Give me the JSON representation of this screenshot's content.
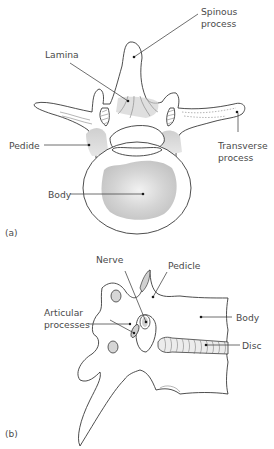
{
  "figure": {
    "panels": [
      {
        "id": "a",
        "marker": "(a)",
        "view": "superior (top-down) view of vertebra",
        "labels": {
          "spinous_process_1": "Spinous",
          "spinous_process_2": "process",
          "lamina": "Lamina",
          "pedicle": "Pedide",
          "transverse_process_1": "Transverse",
          "transverse_process_2": "process",
          "body": "Body"
        }
      },
      {
        "id": "b",
        "marker": "(b)",
        "view": "lateral view of vertebrae with disc",
        "labels": {
          "nerve": "Nerve",
          "pedicle": "Pedicle",
          "articular_processes_1": "Articular",
          "articular_processes_2": "processes",
          "body": "Body",
          "disc": "Disc"
        }
      }
    ],
    "colors": {
      "line": "#3a3a3a",
      "text": "#4a4a4a",
      "shading": "#c8c8c8",
      "background": "#ffffff"
    }
  }
}
